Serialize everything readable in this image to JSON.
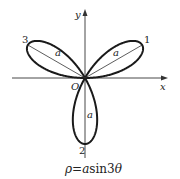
{
  "diagram": {
    "title": "ρ=asin3θ",
    "caption": {
      "rho": "ρ",
      "eq": "=",
      "a": "a",
      "rest": "sin3",
      "theta": "θ"
    },
    "axes": {
      "x_label": "x",
      "y_label": "y",
      "origin_label": "O"
    },
    "petals": [
      {
        "number": "1",
        "angle_deg": 30,
        "radius_label": "a"
      },
      {
        "number": "2",
        "angle_deg": 270,
        "radius_label": "a"
      },
      {
        "number": "3",
        "angle_deg": 150,
        "radius_label": "a"
      }
    ],
    "colors": {
      "curve": "#1a1a1a",
      "axis": "#333333"
    }
  }
}
